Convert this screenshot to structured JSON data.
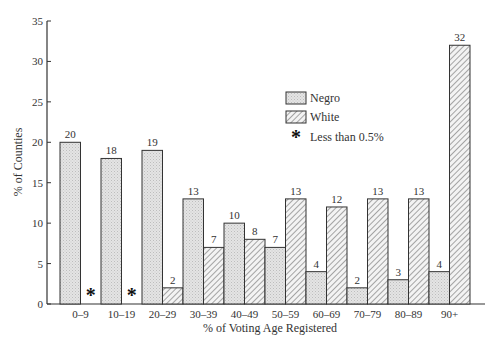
{
  "chart_data": {
    "type": "bar",
    "title": "",
    "xlabel": "% of Voting Age Registered",
    "ylabel": "% of Counties",
    "ylim": [
      0,
      35
    ],
    "yticks": [
      0,
      5,
      10,
      15,
      20,
      25,
      30,
      35
    ],
    "grid": false,
    "legend_position": "upper right (inside plot)",
    "categories": [
      "0–9",
      "10–19",
      "20–29",
      "30–39",
      "40–49",
      "50–59",
      "60–69",
      "70–79",
      "80–89",
      "90+"
    ],
    "series": [
      {
        "name": "Negro",
        "pattern": "stippled",
        "values": [
          20,
          18,
          19,
          13,
          10,
          7,
          4,
          2,
          3,
          4
        ]
      },
      {
        "name": "White",
        "pattern": "hatched",
        "values": [
          0,
          0,
          2,
          7,
          8,
          13,
          12,
          13,
          13,
          32
        ]
      }
    ],
    "value_labels": {
      "Negro": [
        "20",
        "18",
        "19",
        "13",
        "10",
        "7",
        "4",
        "2",
        "3",
        "4"
      ],
      "White": [
        "*",
        "*",
        "2",
        "7",
        "8",
        "13",
        "12",
        "13",
        "13",
        "32"
      ]
    },
    "annotations": [
      {
        "symbol": "*",
        "meaning": "Less than 0.5%"
      }
    ]
  },
  "legend": {
    "items": [
      {
        "label": "Negro"
      },
      {
        "label": "White"
      },
      {
        "label": "Less than 0.5%",
        "symbol": "*"
      }
    ]
  },
  "axes": {
    "x_label": "% of Voting Age Registered",
    "y_label": "% of Counties"
  }
}
